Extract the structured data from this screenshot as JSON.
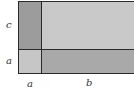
{
  "diagram": {
    "title": "",
    "regions": [
      {
        "id": "top-left",
        "dims": "a x c",
        "color": "#9c9c9c"
      },
      {
        "id": "top-right",
        "dims": "b x c",
        "color": "#c9c9c9"
      },
      {
        "id": "bottom-left",
        "dims": "a x a",
        "color": "#c6c6c6"
      },
      {
        "id": "bottom-right",
        "dims": "b x a",
        "color": "#a9a9a9"
      }
    ],
    "labels": {
      "left_top": "c",
      "left_bottom": "a",
      "bottom_left": "a",
      "bottom_right": "b"
    },
    "line_color": "#2a2a2a"
  }
}
